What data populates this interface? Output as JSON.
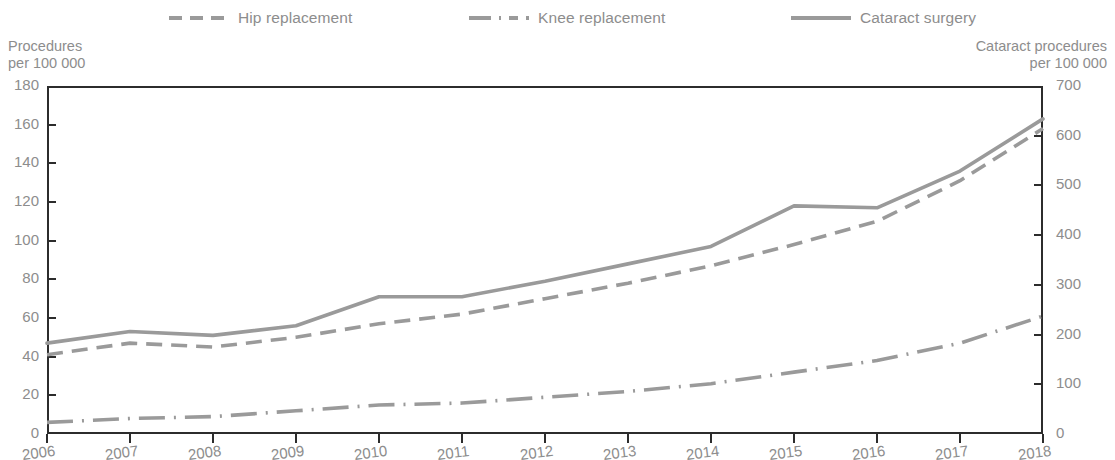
{
  "legend": {
    "items": [
      {
        "label": "Hip replacement",
        "style": "dashed",
        "color": "#9a9a9a"
      },
      {
        "label": "Knee replacement",
        "style": "dash-dot",
        "color": "#9a9a9a"
      },
      {
        "label": "Cataract surgery",
        "style": "solid",
        "color": "#9a9a9a"
      }
    ]
  },
  "axes": {
    "left_title_line1": "Procedures",
    "left_title_line2": "per 100 000",
    "right_title_line1": "Cataract procedures",
    "right_title_line2": "per 100 000",
    "left_ticks": [
      "180",
      "160",
      "140",
      "120",
      "100",
      "80",
      "60",
      "40",
      "20",
      "0"
    ],
    "right_ticks": [
      "700",
      "600",
      "500",
      "400",
      "300",
      "200",
      "100",
      "0"
    ],
    "x_ticks": [
      "2006",
      "2007",
      "2008",
      "2009",
      "2010",
      "2011",
      "2012",
      "2013",
      "2014",
      "2015",
      "2016",
      "2017",
      "2018"
    ]
  },
  "chart_data": {
    "type": "line",
    "title": "",
    "subtitle": "",
    "xlabel": "",
    "ylabel": "Procedures per 100 000",
    "ylabel_secondary": "Cataract procedures per 100 000",
    "x": [
      2006,
      2007,
      2008,
      2009,
      2010,
      2011,
      2012,
      2013,
      2014,
      2015,
      2016,
      2017,
      2018
    ],
    "ylim": [
      0,
      180
    ],
    "ylim_secondary": [
      0,
      700
    ],
    "ytick_step": 20,
    "ytick_step_secondary": 100,
    "grid": false,
    "legend_position": "top",
    "series": [
      {
        "name": "Hip replacement",
        "axis": "left",
        "style": "dashed",
        "color": "#9a9a9a",
        "values": [
          41,
          47,
          45,
          50,
          57,
          62,
          70,
          78,
          87,
          98,
          110,
          131,
          158
        ]
      },
      {
        "name": "Knee replacement",
        "axis": "left",
        "style": "dash-dot",
        "color": "#9a9a9a",
        "values": [
          6,
          8,
          9,
          12,
          15,
          16,
          19,
          22,
          26,
          32,
          38,
          47,
          61
        ]
      },
      {
        "name": "Cataract surgery",
        "axis": "right",
        "style": "solid",
        "color": "#9a9a9a",
        "values_left_scale": [
          47,
          53,
          51,
          56,
          71,
          71,
          79,
          88,
          97,
          118,
          117,
          136,
          163
        ],
        "values": [
          183,
          206,
          198,
          218,
          276,
          276,
          307,
          342,
          377,
          459,
          455,
          529,
          634
        ]
      }
    ]
  }
}
